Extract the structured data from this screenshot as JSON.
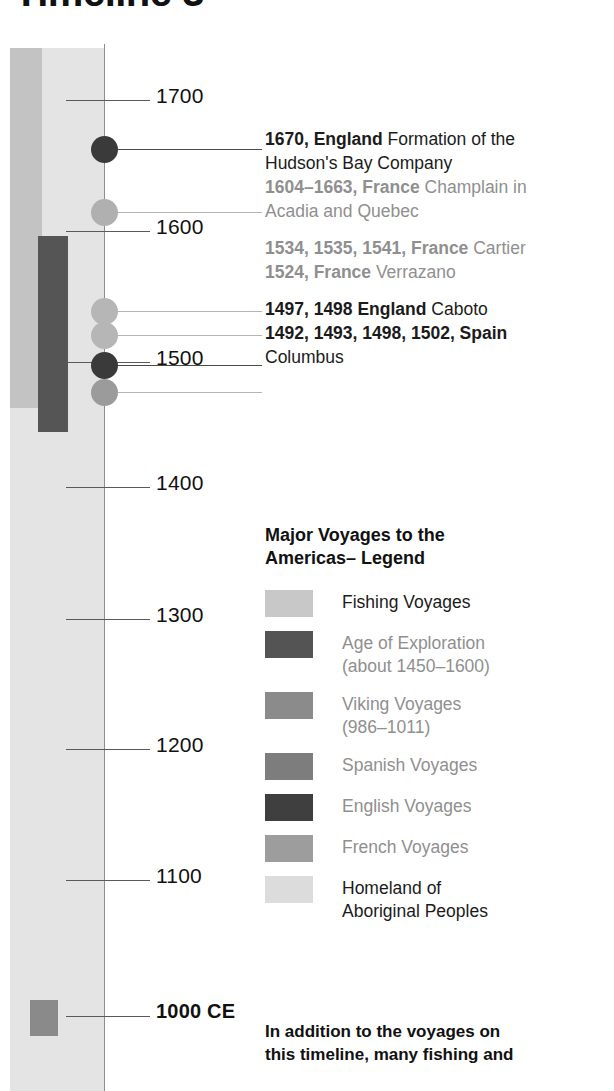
{
  "page": {
    "title": "Timeline 3",
    "axis_line_color": "#8d8d8d"
  },
  "timeline": {
    "ticks": [
      {
        "year": "1700",
        "bold": false,
        "y": 100
      },
      {
        "year": "1600",
        "bold": false,
        "y": 231
      },
      {
        "year": "1500",
        "bold": false,
        "y": 362
      },
      {
        "year": "1400",
        "bold": false,
        "y": 487
      },
      {
        "year": "1300",
        "bold": false,
        "y": 619
      },
      {
        "year": "1200",
        "bold": false,
        "y": 749
      },
      {
        "year": "1100",
        "bold": false,
        "y": 880
      },
      {
        "year": "1000 CE",
        "bold": true,
        "y": 1016
      }
    ],
    "bands": [
      {
        "name": "fishing-voyages-band",
        "color": "#c3c3c3"
      },
      {
        "name": "homeland-band",
        "color": "#e4e4e4"
      },
      {
        "name": "age-of-exploration-band",
        "color": "#555555"
      },
      {
        "name": "viking-voyages-marker",
        "color": "#8a8a8a"
      }
    ],
    "markers": [
      {
        "name": "marker-1670-england",
        "color": "#3a3a3a",
        "y": 149,
        "size": 27
      },
      {
        "name": "marker-1604-france",
        "color": "#b0b0b0",
        "y": 212,
        "size": 27
      },
      {
        "name": "marker-1534-france",
        "color": "#b6b6b6",
        "y": 311,
        "size": 27
      },
      {
        "name": "marker-1524-france",
        "color": "#b6b6b6",
        "y": 335,
        "size": 27
      },
      {
        "name": "marker-1497-england",
        "color": "#3a3a3a",
        "y": 365,
        "size": 27
      },
      {
        "name": "marker-1492-spain",
        "color": "#9b9b9b",
        "y": 392,
        "size": 27
      }
    ]
  },
  "events": [
    {
      "tone": "dark",
      "lines": [
        {
          "bold": "1670, England",
          "rest": " Formation of the"
        },
        {
          "bold": "",
          "rest": "Hudson's Bay Company"
        }
      ]
    },
    {
      "tone": "grey",
      "lines": [
        {
          "bold": "1604–1663, France",
          "rest": " Champlain in"
        },
        {
          "bold": "",
          "rest": "Acadia and Quebec"
        }
      ]
    },
    {
      "tone": "grey",
      "lines": [
        {
          "bold": "1534, 1535, 1541, France",
          "rest": " Cartier"
        }
      ]
    },
    {
      "tone": "grey",
      "lines": [
        {
          "bold": "1524, France",
          "rest": "  Verrazano"
        }
      ]
    },
    {
      "tone": "dark",
      "lines": [
        {
          "bold": "1497, 1498 England",
          "rest": " Caboto"
        }
      ]
    },
    {
      "tone": "dark",
      "lines": [
        {
          "bold": "1492, 1493, 1498, 1502, Spain",
          "rest": ""
        },
        {
          "bold": "",
          "rest": "Columbus"
        }
      ]
    }
  ],
  "legend": {
    "heading_line1": "Major Voyages to the",
    "heading_line2": "Americas– Legend",
    "items": [
      {
        "label_line1": "Fishing Voyages",
        "label_line2": "",
        "color": "#c8c8c8",
        "tone": "dark"
      },
      {
        "label_line1": "Age of Exploration",
        "label_line2": "(about 1450–1600)",
        "color": "#545454",
        "tone": "grey"
      },
      {
        "label_line1": "Viking Voyages",
        "label_line2": "(986–1011)",
        "color": "#8b8b8b",
        "tone": "grey"
      },
      {
        "label_line1": "Spanish Voyages",
        "label_line2": "",
        "color": "#7d7d7d",
        "tone": "grey"
      },
      {
        "label_line1": "English Voyages",
        "label_line2": "",
        "color": "#3f3f3f",
        "tone": "grey"
      },
      {
        "label_line1": "French Voyages",
        "label_line2": "",
        "color": "#9d9d9d",
        "tone": "grey"
      },
      {
        "label_line1": "Homeland of",
        "label_line2": "Aboriginal Peoples",
        "color": "#dcdcdc",
        "tone": "dark"
      }
    ]
  },
  "footnote": {
    "line1": "In addition to the voyages on",
    "line2": "this timeline, many fishing and"
  }
}
